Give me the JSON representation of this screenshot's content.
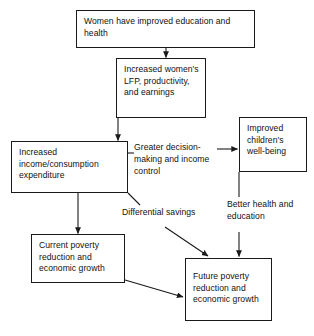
{
  "diagram": {
    "stroke_color": "#1a1a1a",
    "text_color": "#111111",
    "background_color": "#ffffff",
    "nodes": [
      {
        "id": "women-education-health",
        "text": "Women have improved education and health"
      },
      {
        "id": "increased-lfp",
        "text": "Increased women's LFP, productivity, and earnings"
      },
      {
        "id": "increased-income",
        "text": "Increased income/consumption expenditure"
      },
      {
        "id": "improved-children",
        "text": "Improved children's well-being"
      },
      {
        "id": "current-poverty",
        "text": "Current poverty reduction and economic growth"
      },
      {
        "id": "future-poverty",
        "text": "Future poverty reduction and economic growth"
      }
    ],
    "edge_labels": [
      {
        "id": "greater-decision-making",
        "text": "Greater decision-making and income control"
      },
      {
        "id": "differential-savings",
        "text": "Differential savings"
      },
      {
        "id": "better-health-education",
        "text": "Better health and education"
      }
    ],
    "edges": [
      {
        "from": "women-education-health",
        "to": "increased-lfp",
        "kind": "arrow"
      },
      {
        "from": "increased-lfp",
        "to": "increased-income",
        "kind": "arrow"
      },
      {
        "from": "increased-income",
        "to": "greater-decision-making",
        "kind": "line"
      },
      {
        "from": "greater-decision-making",
        "to": "improved-children",
        "kind": "arrow"
      },
      {
        "from": "increased-income",
        "to": "current-poverty",
        "kind": "arrow"
      },
      {
        "from": "increased-income",
        "to": "differential-savings",
        "kind": "line"
      },
      {
        "from": "differential-savings",
        "to": "future-poverty",
        "kind": "arrow"
      },
      {
        "from": "improved-children",
        "to": "better-health-education",
        "kind": "line"
      },
      {
        "from": "better-health-education",
        "to": "future-poverty",
        "kind": "arrow"
      },
      {
        "from": "current-poverty",
        "to": "future-poverty",
        "kind": "arrow"
      }
    ]
  }
}
